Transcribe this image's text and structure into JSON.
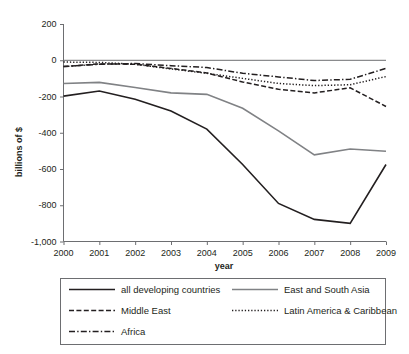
{
  "chart_data": {
    "type": "line",
    "title": "",
    "xlabel": "year",
    "ylabel": "billions of $",
    "x": [
      2000,
      2001,
      2002,
      2003,
      2004,
      2005,
      2006,
      2007,
      2008,
      2009
    ],
    "categories": [
      "2000",
      "2001",
      "2002",
      "2003",
      "2004",
      "2005",
      "2006",
      "2007",
      "2008",
      "2009"
    ],
    "xlim": [
      2000,
      2009
    ],
    "ylim": [
      -1000,
      200
    ],
    "yticks": [
      200,
      0,
      -200,
      -400,
      -600,
      -800,
      -1000
    ],
    "ytick_labels": [
      "200",
      "0",
      "-200",
      "-400",
      "-600",
      "-800",
      "-1,000"
    ],
    "grid": false,
    "legend_position": "bottom",
    "series": [
      {
        "name": "all developing countries",
        "style": "solid",
        "color": "#231f20",
        "width": 1.6,
        "values": [
          -198,
          -170,
          -215,
          -280,
          -380,
          -575,
          -790,
          -878,
          -900,
          -575
        ]
      },
      {
        "name": "East and South Asia",
        "style": "solid",
        "color": "#808285",
        "width": 1.6,
        "values": [
          -128,
          -122,
          -150,
          -180,
          -188,
          -265,
          -390,
          -522,
          -490,
          -502
        ]
      },
      {
        "name": "Middle East",
        "style": "dashed",
        "color": "#231f20",
        "width": 1.5,
        "values": [
          -35,
          -20,
          -22,
          -45,
          -70,
          -120,
          -160,
          -180,
          -152,
          -255
        ]
      },
      {
        "name": "Latin America & Caribbean",
        "style": "dotted",
        "color": "#231f20",
        "width": 1.5,
        "values": [
          -10,
          -12,
          -22,
          -48,
          -72,
          -100,
          -128,
          -140,
          -135,
          -90
        ]
      },
      {
        "name": "Africa",
        "style": "dashdot",
        "color": "#231f20",
        "width": 1.5,
        "values": [
          -35,
          -22,
          -18,
          -30,
          -40,
          -72,
          -92,
          -112,
          -105,
          -45
        ]
      }
    ],
    "endpoint_notes": {
      "africa_2009": -45,
      "latin_america_2009": -90,
      "middle_east_2009": -255,
      "all_developing_2009": -575,
      "east_south_asia_2009": -502
    }
  },
  "legend": {
    "entries": [
      {
        "label": "all developing countries",
        "style": "solid",
        "color": "#231f20"
      },
      {
        "label": "East and South Asia",
        "style": "solid",
        "color": "#808285"
      },
      {
        "label": "Middle East",
        "style": "dashed",
        "color": "#231f20"
      },
      {
        "label": "Latin America & Caribbean",
        "style": "dotted",
        "color": "#231f20"
      },
      {
        "label": "Africa",
        "style": "dashdot",
        "color": "#231f20"
      }
    ]
  }
}
